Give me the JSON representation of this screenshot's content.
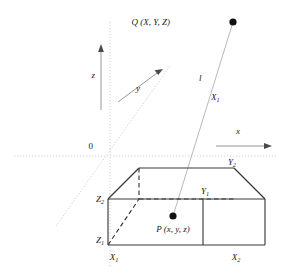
{
  "figure": {
    "type": "3d-geometry-diagram",
    "background_color": "#ffffff",
    "line_color": "#3a3a3a",
    "axis_color": "#c9c9c9",
    "ray_color": "#b0b0b0",
    "point_color": "#111111"
  },
  "axes": {
    "origin_label": "0",
    "x_label": "x",
    "y_label": "y",
    "z_label": "z"
  },
  "points": {
    "q": {
      "label_base": "Q",
      "label_coords": "(X, Y, Z)",
      "label_full": "Q (X, Y, Z)"
    },
    "p": {
      "label_base": "P",
      "label_coords": "(x, y, z)",
      "label_full": "P (x, y, z)"
    }
  },
  "ray": {
    "label": "l"
  },
  "box_labels": {
    "x1_ray": {
      "base": "X",
      "sub": "1"
    },
    "x1_corner": {
      "base": "X",
      "sub": "1"
    },
    "x2_corner": {
      "base": "X",
      "sub": "2"
    },
    "y1_corner": {
      "base": "Y",
      "sub": "1"
    },
    "y2_corner": {
      "base": "Y",
      "sub": "2"
    },
    "z1_corner": {
      "base": "Z",
      "sub": "1"
    },
    "z2_corner": {
      "base": "Z",
      "sub": "2"
    }
  }
}
